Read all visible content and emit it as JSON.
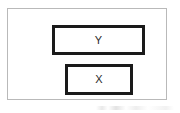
{
  "diagram": {
    "title": "",
    "frame": {
      "border_color": "#b9b9b9",
      "background_color": "#ffffff"
    },
    "nodes": [
      {
        "id": "y",
        "label": "Y",
        "shape": "rectangle",
        "border_color": "#1a1a1a",
        "fill_color": "#ffffff",
        "position": "upper"
      },
      {
        "id": "x",
        "label": "X",
        "shape": "rectangle",
        "border_color": "#1a1a1a",
        "fill_color": "#ffffff",
        "position": "lower"
      }
    ]
  }
}
